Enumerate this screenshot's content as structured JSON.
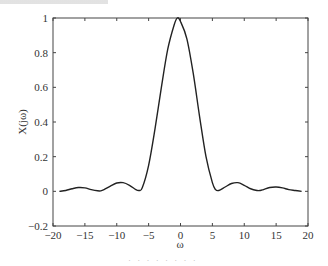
{
  "chart_data": {
    "type": "line",
    "title": "",
    "xlabel": "ω",
    "ylabel": "X(jω)",
    "xlim": [
      -20,
      20
    ],
    "ylim": [
      -0.2,
      1
    ],
    "xticks": [
      -20,
      -15,
      -10,
      -5,
      0,
      5,
      10,
      15,
      20
    ],
    "yticks": [
      -0.2,
      0,
      0.2,
      0.4,
      0.6,
      0.8,
      1
    ],
    "xtick_labels": [
      "−20",
      "−15",
      "−10",
      "−5",
      "0",
      "5",
      "10",
      "15",
      "20"
    ],
    "ytick_labels": [
      "−0.2",
      "0",
      "0.2",
      "0.4",
      "0.6",
      "0.8",
      "1"
    ],
    "grid": false,
    "legend": null,
    "series": [
      {
        "name": "X(jω)",
        "color": "#222222",
        "x": [
          -19,
          -18,
          -17,
          -16,
          -15,
          -14,
          -13,
          -12.5,
          -12,
          -11,
          -10,
          -9,
          -8,
          -7,
          -6.5,
          -6,
          -5,
          -4,
          -3,
          -2,
          -1,
          -0.5,
          0,
          1,
          2,
          3,
          4,
          5,
          5.5,
          6,
          7,
          8,
          9,
          10,
          11,
          12,
          12.5,
          13,
          14,
          15,
          16,
          17,
          18,
          19
        ],
        "values": [
          0.0,
          0.005,
          0.015,
          0.022,
          0.02,
          0.01,
          0.003,
          0.003,
          0.01,
          0.03,
          0.048,
          0.05,
          0.035,
          0.01,
          0.005,
          0.02,
          0.15,
          0.36,
          0.6,
          0.82,
          0.96,
          1.0,
          0.98,
          0.88,
          0.68,
          0.43,
          0.2,
          0.05,
          0.01,
          0.005,
          0.025,
          0.045,
          0.05,
          0.035,
          0.015,
          0.005,
          0.005,
          0.01,
          0.022,
          0.025,
          0.02,
          0.01,
          0.005,
          0.0
        ]
      }
    ]
  },
  "caption": {
    "top_fragment": "",
    "bottom_fragment": "· · · · · · · ·"
  }
}
